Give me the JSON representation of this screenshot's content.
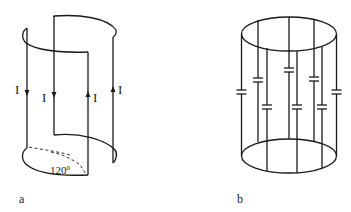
{
  "figure_a": {
    "caption": "a",
    "current_label": "I",
    "angle_label": "120",
    "angle_unit": "0",
    "wires": [
      {
        "position": "left-front",
        "direction": "down"
      },
      {
        "position": "left-back",
        "direction": "down"
      },
      {
        "position": "right-front",
        "direction": "up"
      },
      {
        "position": "right-back",
        "direction": "up"
      }
    ]
  },
  "figure_b": {
    "caption": "b",
    "capacitor_count": 8,
    "rod_count": 8
  },
  "colors": {
    "line": "#1a1a1a",
    "background": "#ffffff"
  }
}
